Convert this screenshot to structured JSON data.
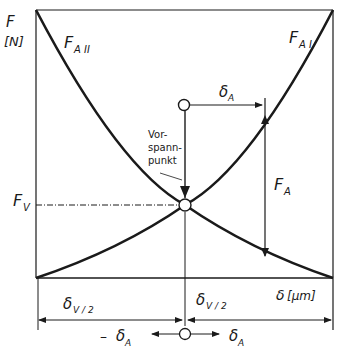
{
  "diagram": {
    "y_axis": {
      "symbol": "F",
      "unit": "[N]"
    },
    "x_axis": {
      "symbol": "δ",
      "unit": "[μm]"
    },
    "curves": [
      {
        "name": "F_A II",
        "main": "F",
        "sub": "A II",
        "direction": "decreasing"
      },
      {
        "name": "F_A I",
        "main": "F",
        "sub": "A I",
        "direction": "increasing"
      }
    ],
    "preload_point_label": [
      "Vor-",
      "spann-",
      "punkt"
    ],
    "preload_force": {
      "main": "F",
      "sub": "V"
    },
    "displacement_delta_a": {
      "main": "δ",
      "sub": "A"
    },
    "force_fa": {
      "main": "F",
      "sub": "A"
    },
    "half_preload_left": {
      "main": "δ",
      "sub": "V / 2"
    },
    "half_preload_right": {
      "main": "δ",
      "sub": "V / 2"
    },
    "bottom_neg": {
      "prefix": "– ",
      "main": "δ",
      "sub": "A"
    },
    "bottom_pos": {
      "main": "δ",
      "sub": "A"
    },
    "colors": {
      "line": "#1a1a1a",
      "background": "#ffffff"
    }
  }
}
